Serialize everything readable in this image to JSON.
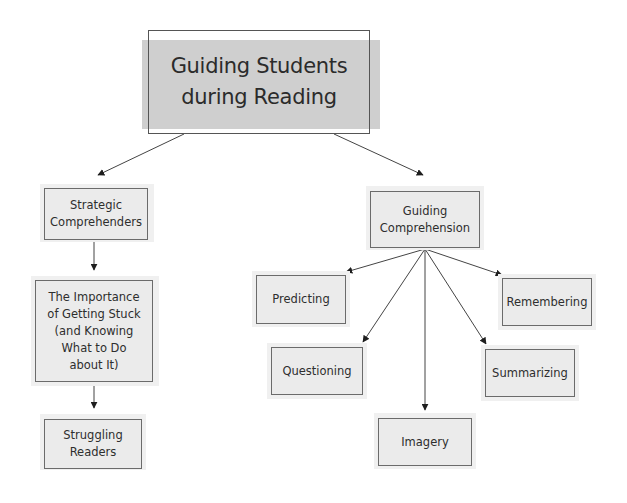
{
  "diagram": {
    "title": {
      "line1": "Guiding Students",
      "line2": "during Reading"
    },
    "nodes": [
      {
        "id": "strategic-comprehenders",
        "lines": [
          "Strategic",
          "Comprehenders"
        ]
      },
      {
        "id": "importance-of-getting-stuck",
        "lines": [
          "The Importance",
          "of Getting Stuck",
          "(and Knowing",
          "What to Do",
          "about It)"
        ]
      },
      {
        "id": "struggling-readers",
        "lines": [
          "Struggling",
          "Readers"
        ]
      },
      {
        "id": "guiding-comprehension",
        "lines": [
          "Guiding",
          "Comprehension"
        ]
      },
      {
        "id": "predicting",
        "lines": [
          "Predicting"
        ]
      },
      {
        "id": "remembering",
        "lines": [
          "Remembering"
        ]
      },
      {
        "id": "questioning",
        "lines": [
          "Questioning"
        ]
      },
      {
        "id": "summarizing",
        "lines": [
          "Summarizing"
        ]
      },
      {
        "id": "imagery",
        "lines": [
          "Imagery"
        ]
      }
    ],
    "edges": [
      {
        "from": "title",
        "to": "strategic-comprehenders"
      },
      {
        "from": "title",
        "to": "guiding-comprehension"
      },
      {
        "from": "strategic-comprehenders",
        "to": "importance-of-getting-stuck"
      },
      {
        "from": "importance-of-getting-stuck",
        "to": "struggling-readers"
      },
      {
        "from": "guiding-comprehension",
        "to": "predicting"
      },
      {
        "from": "guiding-comprehension",
        "to": "remembering"
      },
      {
        "from": "guiding-comprehension",
        "to": "questioning"
      },
      {
        "from": "guiding-comprehension",
        "to": "summarizing"
      },
      {
        "from": "guiding-comprehension",
        "to": "imagery"
      }
    ],
    "colors": {
      "title_fill": "#cfcfcf",
      "node_fill": "#ebebeb",
      "border": "#6b6b6b",
      "line": "#333333",
      "text": "#2e2e2e"
    }
  }
}
